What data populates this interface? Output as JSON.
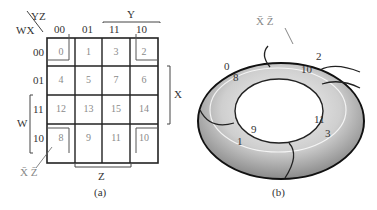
{
  "kmap": {
    "corner_row_var": "WX",
    "corner_col_var": "YZ",
    "col_headers": [
      "00",
      "01",
      "11",
      "10"
    ],
    "row_headers": [
      "00",
      "01",
      "11",
      "10"
    ],
    "cells": [
      [
        "0",
        "1",
        "3",
        "2"
      ],
      [
        "4",
        "5",
        "7",
        "6"
      ],
      [
        "12",
        "13",
        "15",
        "14"
      ],
      [
        "8",
        "9",
        "11",
        "10"
      ]
    ],
    "bracket_labels": {
      "top": "Y",
      "right": "X",
      "left": "W",
      "bottom": "Z"
    },
    "group_label": "X̄ Z̄",
    "caption": "(a)"
  },
  "torus": {
    "group_label": "X̄ Z̄",
    "numbers": [
      "0",
      "8",
      "2",
      "10",
      "9",
      "1",
      "11",
      "3"
    ],
    "caption": "(b)"
  }
}
